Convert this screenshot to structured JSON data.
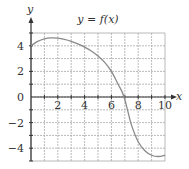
{
  "chart_data": {
    "type": "line",
    "title": "y = f(x)",
    "xlabel": "x",
    "ylabel": "y",
    "xlim": [
      0,
      10
    ],
    "ylim": [
      -5,
      5
    ],
    "grid": true,
    "grid_step_x": 1,
    "grid_step_y": 1,
    "x_ticks": [
      2,
      4,
      6,
      8,
      10
    ],
    "x_tick_labels": [
      "2",
      "4",
      "6",
      "8",
      "10"
    ],
    "y_ticks": [
      4,
      2,
      0,
      -2,
      -4
    ],
    "y_tick_labels": [
      "4",
      "2",
      "0",
      "−2",
      "−4"
    ],
    "legend": null,
    "series": [
      {
        "name": "f(x)",
        "x": [
          0,
          0.5,
          1,
          1.5,
          2,
          2.5,
          3,
          3.5,
          4,
          4.5,
          5,
          5.5,
          6,
          6.5,
          6.8,
          7,
          7.2,
          7.5,
          8,
          8.5,
          9,
          9.5,
          10
        ],
        "y": [
          4.0,
          4.35,
          4.55,
          4.62,
          4.6,
          4.5,
          4.35,
          4.15,
          3.9,
          3.6,
          3.2,
          2.7,
          2.0,
          1.0,
          0.4,
          -0.2,
          -1.0,
          -2.2,
          -3.5,
          -4.2,
          -4.55,
          -4.65,
          -4.55
        ]
      }
    ],
    "colors": {
      "curve": "#8a8a8a",
      "grid": "#a8a8a8",
      "axis": "#333333",
      "border": "#a8a8a8"
    }
  }
}
